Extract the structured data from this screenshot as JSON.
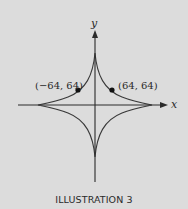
{
  "figure": {
    "caption": "ILLUSTRATION 3",
    "x_axis_label": "x",
    "y_axis_label": "y",
    "points": [
      {
        "label": "(−64, 64)",
        "x": -64,
        "y": 64
      },
      {
        "label": "(64, 64)",
        "x": 64,
        "y": 64
      }
    ],
    "curve": "astroid x^(2/3) + y^(2/3) = a^(2/3)",
    "colors": {
      "background": "#dcdcdc",
      "curve": "#3a3a3a",
      "axis": "#2a2a2a",
      "point": "#111111"
    }
  }
}
